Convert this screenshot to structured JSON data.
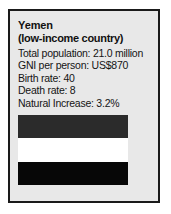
{
  "card": {
    "title": "Yemen",
    "subtitle": "(low-income country)",
    "stats": [
      {
        "label": "Total population",
        "value": "21.0 million",
        "text": "Total population: 21.0 million"
      },
      {
        "label": "GNI per person",
        "value": "US$870",
        "text": "GNI per person: US$870"
      },
      {
        "label": "Birth rate",
        "value": "40",
        "text": "Birth rate: 40"
      },
      {
        "label": "Death rate",
        "value": "8",
        "text": "Death rate: 8"
      },
      {
        "label": "Natural Increase",
        "value": "3.2%",
        "text": "Natural Increase: 3.2%"
      }
    ],
    "flag": {
      "name": "yemen-flag",
      "bands": [
        {
          "name": "top-band",
          "color": "#2b2b2b"
        },
        {
          "name": "middle-band",
          "color": "#ffffff"
        },
        {
          "name": "bottom-band",
          "color": "#070707"
        }
      ]
    },
    "colors": {
      "card_background": "#e8e8e8",
      "card_border": "#1a1a1a",
      "text": "#141414",
      "page_background": "#ffffff"
    }
  }
}
